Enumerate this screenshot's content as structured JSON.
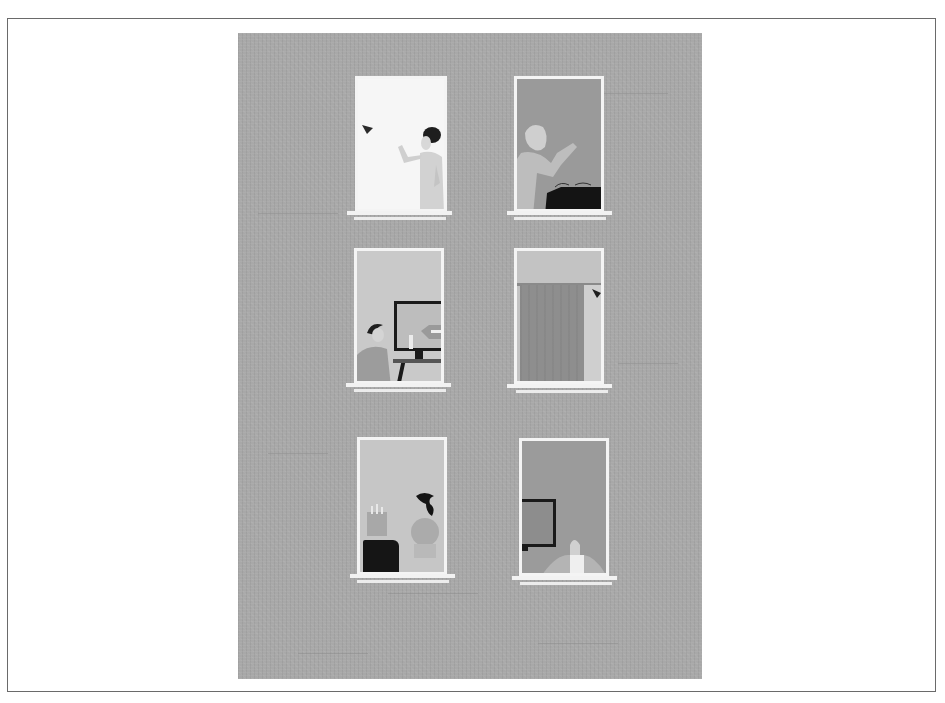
{
  "illustration": {
    "subject": "Apartment building facade with six lit windows",
    "colors": {
      "page_background": "#ffffff",
      "frame_border": "#6a6a6a",
      "wall": "#a8a8a8",
      "window_frame": "#f4f4f4"
    },
    "windows": [
      {
        "position": "top-left",
        "scene": "Woman with dark hair bun waving, small dark bird flying in",
        "background": "#f6f6f6"
      },
      {
        "position": "top-right",
        "scene": "Person with light hair leaning on dark sofa, gesturing",
        "background": "#9a9a9a"
      },
      {
        "position": "middle-left",
        "scene": "Man sitting at desk watching a TV / monitor",
        "background": "#c9c9c9"
      },
      {
        "position": "middle-right",
        "scene": "Drawn curtain on a rail with a small bird perched",
        "background": "#bdbdbd"
      },
      {
        "position": "bottom-left",
        "scene": "Woman with ponytail, plant pot and dark armchair",
        "background": "#c6c6c6"
      },
      {
        "position": "bottom-right",
        "scene": "Person leaning on window sill, picture frame on wall",
        "background": "#9b9b9b"
      }
    ]
  }
}
